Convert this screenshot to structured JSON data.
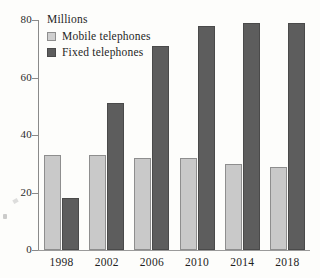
{
  "chart_data": {
    "type": "bar",
    "title": "",
    "unit_label": "Millions",
    "xlabel": "",
    "ylabel": "",
    "categories": [
      "1998",
      "2002",
      "2006",
      "2010",
      "2014",
      "2018"
    ],
    "series": [
      {
        "name": "Mobile telephones",
        "color": "#c9c9c9",
        "values": [
          33,
          33,
          32,
          32,
          30,
          29
        ]
      },
      {
        "name": "Fixed telephones",
        "color": "#5d5d5d",
        "values": [
          18,
          51,
          71,
          78,
          79,
          79
        ]
      }
    ],
    "ylim": [
      0,
      80
    ],
    "yticks": [
      0,
      20,
      40,
      60,
      80
    ],
    "ytick_labels": [
      "0",
      "20",
      "40",
      "60",
      "80"
    ],
    "grid": false,
    "legend_position": "top-left"
  },
  "legend": {
    "items": [
      {
        "label": "Mobile telephones",
        "swatch": "mobile"
      },
      {
        "label": "Fixed telephones",
        "swatch": "fixed"
      }
    ]
  },
  "axes": {
    "unit": "Millions"
  }
}
